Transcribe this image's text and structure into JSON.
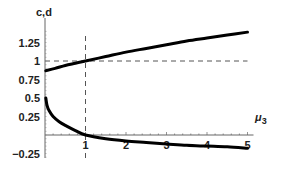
{
  "chart_data": {
    "type": "line",
    "title": "",
    "ylabel": "c,d",
    "xlabel": "μ3",
    "xlim": [
      0,
      5
    ],
    "ylim": [
      -0.25,
      1.4
    ],
    "grid": false,
    "x_ticks": [
      1,
      2,
      3,
      4,
      5
    ],
    "x_tick_labels": [
      "1",
      "2",
      "3",
      "4",
      "5"
    ],
    "y_ticks": [
      -0.25,
      0.25,
      0.5,
      0.75,
      1,
      1.25
    ],
    "y_tick_labels": [
      "-0.25",
      "0.25",
      "0.5",
      "0.75",
      "1",
      "1.25"
    ],
    "series": [
      {
        "name": "c",
        "x": [
          0.02,
          0.25,
          0.5,
          0.75,
          1,
          1.5,
          2,
          2.5,
          3,
          3.5,
          4,
          4.5,
          5
        ],
        "values": [
          0.87,
          0.9,
          0.94,
          0.97,
          1.0,
          1.06,
          1.12,
          1.17,
          1.22,
          1.27,
          1.31,
          1.35,
          1.39
        ]
      },
      {
        "name": "d",
        "x": [
          0.02,
          0.05,
          0.1,
          0.2,
          0.35,
          0.5,
          0.75,
          1,
          1.5,
          2,
          2.5,
          3,
          3.5,
          4,
          4.5,
          5
        ],
        "values": [
          0.5,
          0.4,
          0.33,
          0.25,
          0.18,
          0.13,
          0.06,
          0.0,
          -0.05,
          -0.08,
          -0.1,
          -0.12,
          -0.14,
          -0.15,
          -0.16,
          -0.18
        ]
      }
    ],
    "annotations": [
      {
        "type": "hline",
        "y": 1,
        "style": "dashed"
      },
      {
        "type": "vline",
        "x": 1,
        "style": "dashed"
      }
    ]
  }
}
